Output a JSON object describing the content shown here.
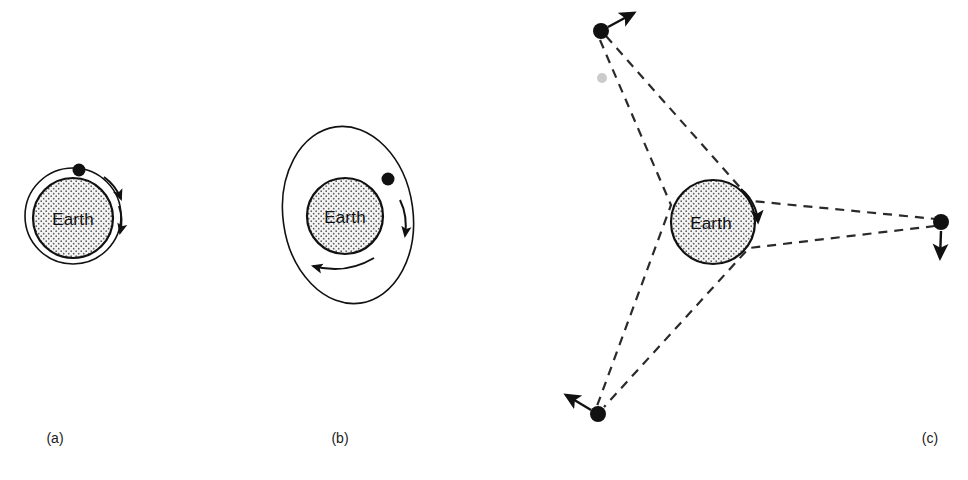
{
  "figure": {
    "background_color": "#ffffff",
    "ink_color": "#111111",
    "dash_color": "#2a2a2a",
    "earth_fill_pattern": "stipple-dots",
    "earth_fill_color": "#f2f2f2",
    "earth_dot_color": "#555555",
    "width": 968,
    "height": 480
  },
  "panels": [
    {
      "id": "a",
      "caption": "(a)",
      "caption_x": 55,
      "caption_y": 443,
      "earth_label": "Earth",
      "earth": {
        "cx": 73,
        "cy": 218,
        "r": 40
      },
      "orbit": {
        "type": "circle",
        "cx": 73,
        "cy": 216,
        "rx": 48,
        "ry": 48,
        "rotation": 0
      },
      "satellites": [
        {
          "cx": 79,
          "cy": 170,
          "r": 6.5,
          "name": "satellite-low-orbit"
        }
      ],
      "direction_arrows": [
        {
          "name": "orbit-direction-arrow-upper",
          "x": 116,
          "y": 196,
          "angle": 118
        },
        {
          "name": "orbit-direction-arrow-lower",
          "x": 118,
          "y": 228,
          "angle": 110
        }
      ],
      "description": "Low circular orbit just above Earth's surface, satellite moving clockwise"
    },
    {
      "id": "b",
      "caption": "(b)",
      "caption_x": 340,
      "caption_y": 443,
      "earth_label": "Earth",
      "earth": {
        "cx": 345,
        "cy": 216,
        "r": 38
      },
      "orbit": {
        "type": "ellipse",
        "cx": 348,
        "cy": 215,
        "rx": 65,
        "ry": 89,
        "rotation": -8
      },
      "satellites": [
        {
          "cx": 388,
          "cy": 179,
          "r": 6.5,
          "name": "satellite-elliptical-orbit"
        }
      ],
      "direction_arrows": [
        {
          "name": "orbit-direction-arrow-right",
          "x": 404,
          "y": 231,
          "angle": 100
        },
        {
          "name": "orbit-direction-arrow-bottom",
          "x": 316,
          "y": 264,
          "angle": 194
        }
      ],
      "description": "Larger elliptical orbit inclined from vertical, satellite moving clockwise"
    },
    {
      "id": "c",
      "caption": "(c)",
      "caption_x": 930,
      "caption_y": 443,
      "earth_label": "Earth",
      "earth": {
        "cx": 713,
        "cy": 222,
        "r": 42
      },
      "orbit": null,
      "satellites": [
        {
          "name": "satellite-geostationary-top",
          "cx": 601,
          "cy": 31,
          "r": 8,
          "velocity_arrow": {
            "x1": 608,
            "y1": 27,
            "x2": 638,
            "y2": 11
          }
        },
        {
          "name": "satellite-geostationary-right",
          "cx": 941,
          "cy": 222,
          "r": 8,
          "velocity_arrow": {
            "x1": 941,
            "y1": 230,
            "x2": 940,
            "y2": 262
          }
        },
        {
          "name": "satellite-geostationary-bottom-left",
          "cx": 598,
          "cy": 414,
          "r": 8,
          "velocity_arrow": {
            "x1": 591,
            "y1": 409,
            "x2": 562,
            "y2": 391
          }
        }
      ],
      "rotation_arrow": {
        "name": "earth-rotation-arrow",
        "start_angle": -72,
        "end_angle": 36,
        "radius": 48
      },
      "sight_lines": [
        {
          "from": "satellite-geostationary-top",
          "to": "satellite-geostationary-right",
          "tangent_side": "upper"
        },
        {
          "from": "satellite-geostationary-top",
          "to": "satellite-geostationary-bottom-left",
          "tangent_side": "left"
        },
        {
          "from": "satellite-geostationary-right",
          "to": "satellite-geostationary-bottom-left",
          "tangent_side": "lower"
        }
      ],
      "description": "Three geostationary satellites spaced 120 degrees apart, dashed tangent sight-lines to Earth, Earth rotating"
    }
  ],
  "artifacts": [
    {
      "name": "scan-smudge",
      "cx": 602,
      "cy": 78,
      "rx": 5,
      "ry": 5
    }
  ]
}
